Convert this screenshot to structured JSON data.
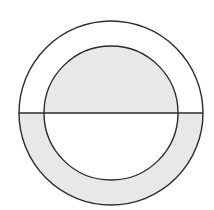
{
  "diagram": {
    "colors": {
      "background": "#ffffff",
      "shade": "#e8e8e8",
      "stroke": "#2b2b2b"
    },
    "outer_circle": {
      "cx": 111,
      "cy": 113,
      "r": 92
    },
    "inner_circle": {
      "cx": 111,
      "cy": 113,
      "r": 67
    },
    "diameter_line": {
      "x1": 19,
      "y1": 113,
      "x2": 203,
      "y2": 113
    }
  }
}
